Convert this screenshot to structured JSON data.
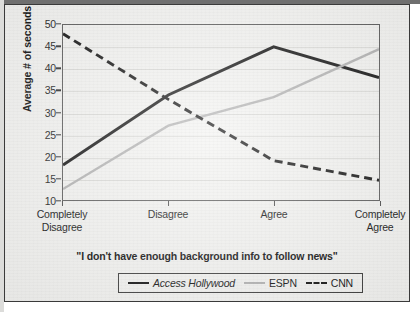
{
  "chart_data": {
    "type": "line",
    "title": "",
    "caption": "\"I don't have enough background info to follow news\"",
    "xlabel": "",
    "ylabel": "Average # of seconds",
    "categories": [
      "Completely Disagree",
      "Disagree",
      "Agree",
      "Completely Agree"
    ],
    "category_lines": [
      [
        "Completely",
        "Disagree"
      ],
      [
        "Disagree"
      ],
      [
        "Agree"
      ],
      [
        "Completely",
        "Agree"
      ]
    ],
    "ylim": [
      10,
      50
    ],
    "yticks": [
      10,
      15,
      20,
      25,
      30,
      35,
      40,
      45,
      50
    ],
    "grid": true,
    "legend_position": "bottom",
    "series": [
      {
        "name": "Access Hollywood",
        "style": "solid",
        "color": "#111111",
        "italic": true,
        "values": [
          18,
          34,
          45,
          38
        ]
      },
      {
        "name": "ESPN",
        "style": "solid",
        "color": "#b2b2b2",
        "italic": false,
        "values": [
          12.5,
          27,
          33.5,
          44.5
        ]
      },
      {
        "name": "CNN",
        "style": "dashed",
        "color": "#111111",
        "italic": false,
        "values": [
          48,
          33,
          19,
          14.5
        ]
      }
    ]
  },
  "colors": {
    "page_background": "#f3f3f1",
    "axis": "#5a5a5a",
    "gridline": "#dcdcd9",
    "text": "#111111"
  }
}
